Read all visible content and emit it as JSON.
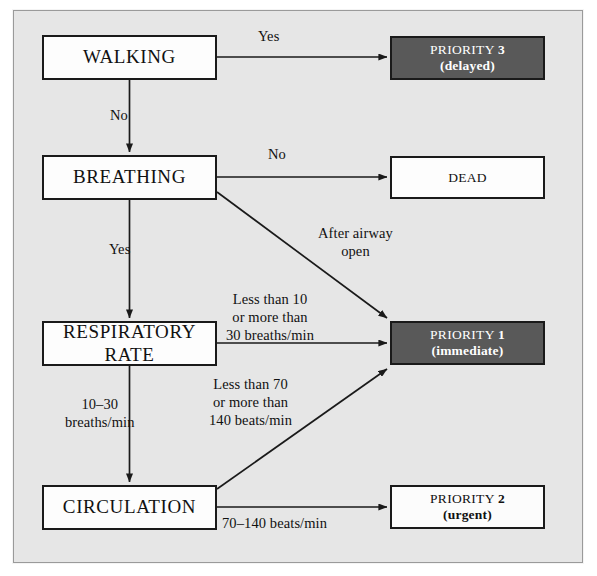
{
  "diagram": {
    "background_color": "#e6e6e6",
    "dark_box_color": "#595959",
    "line_color": "#1a1a1a"
  },
  "nodes": [
    {
      "id": "walking",
      "label": "WALKING",
      "sub": "",
      "kind": "decision",
      "x": 42,
      "y": 35,
      "w": 175,
      "h": 45
    },
    {
      "id": "breathing",
      "label": "BREATHING",
      "sub": "",
      "kind": "decision",
      "x": 42,
      "y": 155,
      "w": 175,
      "h": 45
    },
    {
      "id": "respiratory-rate",
      "label": "RESPIRATORY RATE",
      "sub": "",
      "kind": "decision",
      "x": 42,
      "y": 321,
      "w": 175,
      "h": 45
    },
    {
      "id": "circulation",
      "label": "CIRCULATION",
      "sub": "",
      "kind": "decision",
      "x": 42,
      "y": 485,
      "w": 175,
      "h": 45
    },
    {
      "id": "priority-3",
      "label": "PRIORITY 3",
      "sub": "(delayed)",
      "kind": "outcome-dark",
      "x": 390,
      "y": 36,
      "w": 155,
      "h": 44
    },
    {
      "id": "dead",
      "label": "DEAD",
      "sub": "",
      "kind": "outcome-light",
      "x": 390,
      "y": 156,
      "w": 155,
      "h": 43
    },
    {
      "id": "priority-1",
      "label": "PRIORITY 1",
      "sub": "(immediate)",
      "kind": "outcome-dark",
      "x": 390,
      "y": 321,
      "w": 155,
      "h": 44
    },
    {
      "id": "priority-2",
      "label": "PRIORITY 2",
      "sub": "(urgent)",
      "kind": "outcome-plain",
      "x": 390,
      "y": 485,
      "w": 155,
      "h": 44
    }
  ],
  "edge_labels": [
    {
      "id": "walking-yes",
      "text": "Yes",
      "x": 258,
      "y": 28
    },
    {
      "id": "walking-no",
      "text": "No",
      "x": 110,
      "y": 107
    },
    {
      "id": "breathing-no",
      "text": "No",
      "x": 268,
      "y": 146
    },
    {
      "id": "breathing-yes",
      "text": "Yes",
      "x": 109,
      "y": 241
    },
    {
      "id": "after-airway-open",
      "text": "After airway\nopen",
      "x": 318,
      "y": 225
    },
    {
      "id": "respiratory-abnormal",
      "text": "Less than 10\nor more than\n30 breaths/min",
      "x": 226,
      "y": 291
    },
    {
      "id": "respiratory-normal",
      "text": "10–30\nbreaths/min",
      "x": 65,
      "y": 396
    },
    {
      "id": "circulation-abnormal",
      "text": "Less than 70\nor more than\n140 beats/min",
      "x": 209,
      "y": 376
    },
    {
      "id": "circulation-normal",
      "text": "70–140 beats/min",
      "x": 222,
      "y": 515
    }
  ],
  "connectors": [
    {
      "id": "walking-to-priority3",
      "from": "walking",
      "to": "priority-3",
      "style": "straight-arrow"
    },
    {
      "id": "walking-to-breathing",
      "from": "walking",
      "to": "breathing",
      "style": "straight-arrow"
    },
    {
      "id": "breathing-to-dead",
      "from": "breathing",
      "to": "dead",
      "style": "straight-arrow"
    },
    {
      "id": "breathing-to-priority1",
      "from": "breathing",
      "to": "priority-1",
      "style": "diagonal-arrow"
    },
    {
      "id": "breathing-to-respiratory",
      "from": "breathing",
      "to": "respiratory-rate",
      "style": "straight-arrow"
    },
    {
      "id": "respiratory-to-priority1",
      "from": "respiratory-rate",
      "to": "priority-1",
      "style": "straight-arrow"
    },
    {
      "id": "respiratory-to-circulation",
      "from": "respiratory-rate",
      "to": "circulation",
      "style": "straight-arrow"
    },
    {
      "id": "circulation-to-priority1",
      "from": "circulation",
      "to": "priority-1",
      "style": "diagonal-arrow"
    },
    {
      "id": "circulation-to-priority2",
      "from": "circulation",
      "to": "priority-2",
      "style": "straight-arrow"
    }
  ]
}
